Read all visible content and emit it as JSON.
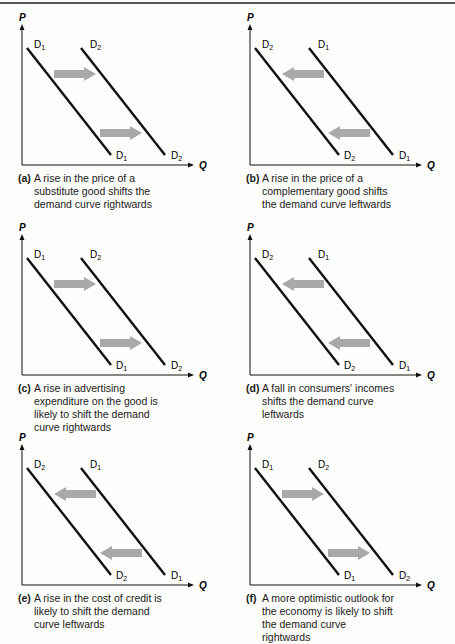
{
  "panels": [
    {
      "id": "a",
      "tag": "(a)",
      "caption": "A rise in the price of a substitute good shifts the demand curve rightwards",
      "direction": "right",
      "left_curve_label": "D1",
      "right_curve_label": "D2"
    },
    {
      "id": "b",
      "tag": "(b)",
      "caption": "A rise in the price of a complementary good shifts the demand curve leftwards",
      "direction": "left",
      "left_curve_label": "D2",
      "right_curve_label": "D1"
    },
    {
      "id": "c",
      "tag": "(c)",
      "caption": "A rise in advertising expenditure on the good is likely to shift the demand curve rightwards",
      "direction": "right",
      "left_curve_label": "D1",
      "right_curve_label": "D2"
    },
    {
      "id": "d",
      "tag": "(d)",
      "caption": "A fall in consumers' incomes shifts the demand curve leftwards",
      "direction": "left",
      "left_curve_label": "D2",
      "right_curve_label": "D1"
    },
    {
      "id": "e",
      "tag": "(e)",
      "caption": "A rise in the cost of credit is likely to shift the demand curve leftwards",
      "direction": "left",
      "left_curve_label": "D2",
      "right_curve_label": "D1"
    },
    {
      "id": "f",
      "tag": "(f)",
      "caption": "A more optimistic outlook for the economy is likely to shift the demand curve rightwards",
      "direction": "right",
      "left_curve_label": "D1",
      "right_curve_label": "D2"
    }
  ],
  "axes": {
    "y_label": "P",
    "x_label": "Q"
  },
  "colors": {
    "line": "#111111",
    "arrow": "#a9a9a9",
    "rule": "#555555"
  }
}
